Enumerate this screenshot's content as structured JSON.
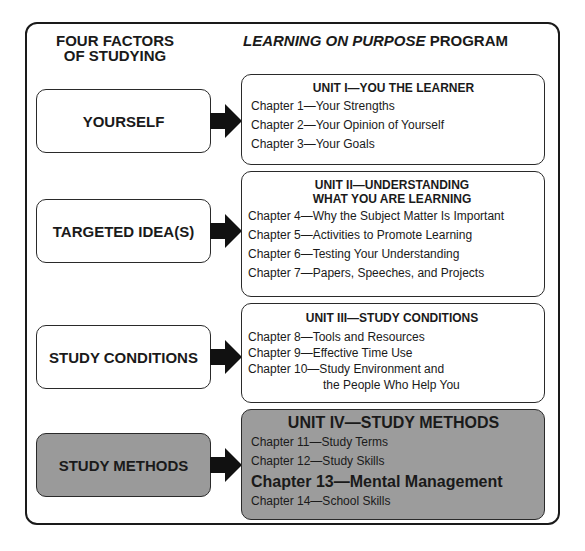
{
  "headers": {
    "left_line1": "FOUR FACTORS",
    "left_line2": "OF STUDYING",
    "right_italic": "LEARNING ON PURPOSE",
    "right_plain": " PROGRAM"
  },
  "factors": [
    {
      "label": "YOURSELF",
      "highlighted": false
    },
    {
      "label": "TARGETED IDEA(S)",
      "highlighted": false
    },
    {
      "label": "STUDY CONDITIONS",
      "highlighted": false
    },
    {
      "label": "STUDY METHODS",
      "highlighted": true
    }
  ],
  "units": [
    {
      "title": "UNIT I—YOU THE LEARNER",
      "chapters": [
        "Chapter 1—Your Strengths",
        "Chapter 2—Your Opinion of Yourself",
        "Chapter 3—Your Goals"
      ]
    },
    {
      "title_line1": "UNIT II—UNDERSTANDING",
      "title_line2": "WHAT YOU ARE LEARNING",
      "chapters": [
        "Chapter 4—Why the Subject Matter Is Important",
        "Chapter 5—Activities to Promote Learning",
        "Chapter 6—Testing Your Understanding",
        "Chapter 7—Papers, Speeches, and Projects"
      ]
    },
    {
      "title": "UNIT III—STUDY CONDITIONS",
      "chapters": [
        "Chapter 8—Tools and Resources",
        "Chapter 9—Effective Time Use",
        "Chapter 10—Study Environment and",
        "the People Who Help You"
      ]
    },
    {
      "title": "UNIT IV—STUDY METHODS",
      "chapters": [
        "Chapter 11—Study Terms",
        "Chapter 12—Study Skills",
        "Chapter 13—Mental Management",
        "Chapter 14—School Skills"
      ],
      "emphasized_chapter": "Chapter 13—Mental Management"
    }
  ],
  "colors": {
    "highlight_fill": "#9c9c9c",
    "border": "#1a1a1a",
    "arrow": "#111111"
  }
}
